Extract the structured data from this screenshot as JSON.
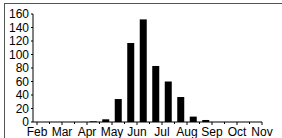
{
  "chart_data": {
    "type": "bar",
    "title": "",
    "xlabel": "",
    "ylabel": "",
    "ylim": [
      0,
      160
    ],
    "yticks": [
      0,
      20,
      40,
      60,
      80,
      100,
      120,
      140,
      160
    ],
    "grid": false,
    "legend": null,
    "month_labels": [
      "Feb",
      "Mar",
      "Apr",
      "May",
      "Jun",
      "Jul",
      "Aug",
      "Sep",
      "Oct",
      "Nov"
    ],
    "categories": [
      "Feb-1",
      "Feb-2",
      "Mar-1",
      "Mar-2",
      "Apr-1",
      "Apr-2",
      "May-1",
      "May-2",
      "Jun-1",
      "Jun-2",
      "Jul-1",
      "Jul-2",
      "Aug-1",
      "Aug-2",
      "Sep-1",
      "Sep-2",
      "Oct-1",
      "Oct-2"
    ],
    "values": [
      0,
      0,
      0,
      0,
      1,
      4,
      34,
      117,
      152,
      83,
      60,
      37,
      8,
      3,
      0,
      0,
      0,
      0
    ],
    "bar_color": "#000000"
  }
}
